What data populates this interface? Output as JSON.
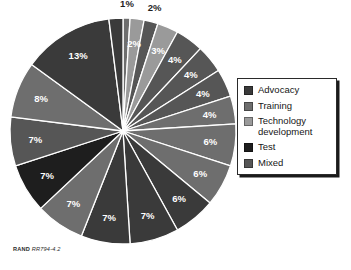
{
  "figure": {
    "source_note_prefix": "RAND",
    "source_note_id": "RR794-4.2"
  },
  "legend": {
    "position": "right",
    "items": [
      {
        "label": "Advocacy",
        "color": "#3a3a3a"
      },
      {
        "label": "Training",
        "color": "#6e6e6e"
      },
      {
        "label": "Technology\ndevelopment",
        "color": "#9a9a9a"
      },
      {
        "label": "Test",
        "color": "#1e1e1e"
      },
      {
        "label": "Mixed",
        "color": "#565656"
      }
    ]
  },
  "chart_data": {
    "type": "pie",
    "title": "",
    "xlabel": "",
    "ylabel": "",
    "units": "percent",
    "total": 100,
    "start_angle_deg": 0,
    "direction": "clockwise",
    "legend_position": "right",
    "grid": false,
    "categories": [
      "Advocacy",
      "Training",
      "Technology development",
      "Test",
      "Mixed"
    ],
    "category_colors": {
      "Advocacy": "#3a3a3a",
      "Training": "#6e6e6e",
      "Technology development": "#9a9a9a",
      "Test": "#1e1e1e",
      "Mixed": "#565656"
    },
    "slices": [
      {
        "label": "1%",
        "value": 1,
        "category": "Training",
        "color": "#6e6e6e",
        "label_placement": "outside"
      },
      {
        "label": "2%",
        "value": 2,
        "category": "Technology development",
        "color": "#9a9a9a",
        "label_placement": "inside"
      },
      {
        "label": "2%",
        "value": 2,
        "category": "Mixed",
        "color": "#565656",
        "label_placement": "outside"
      },
      {
        "label": "3%",
        "value": 3,
        "category": "Technology development",
        "color": "#9a9a9a",
        "label_placement": "inside"
      },
      {
        "label": "4%",
        "value": 4,
        "category": "Mixed",
        "color": "#565656",
        "label_placement": "inside"
      },
      {
        "label": "4%",
        "value": 4,
        "category": "Mixed",
        "color": "#565656",
        "label_placement": "inside"
      },
      {
        "label": "4%",
        "value": 4,
        "category": "Mixed",
        "color": "#565656",
        "label_placement": "inside"
      },
      {
        "label": "4%",
        "value": 4,
        "category": "Training",
        "color": "#6e6e6e",
        "label_placement": "inside"
      },
      {
        "label": "6%",
        "value": 6,
        "category": "Training",
        "color": "#6e6e6e",
        "label_placement": "inside"
      },
      {
        "label": "6%",
        "value": 6,
        "category": "Training",
        "color": "#6e6e6e",
        "label_placement": "inside"
      },
      {
        "label": "6%",
        "value": 6,
        "category": "Advocacy",
        "color": "#3a3a3a",
        "label_placement": "inside"
      },
      {
        "label": "7%",
        "value": 7,
        "category": "Advocacy",
        "color": "#3a3a3a",
        "label_placement": "inside"
      },
      {
        "label": "7%",
        "value": 7,
        "category": "Advocacy",
        "color": "#3a3a3a",
        "label_placement": "inside"
      },
      {
        "label": "7%",
        "value": 7,
        "category": "Training",
        "color": "#6e6e6e",
        "label_placement": "inside"
      },
      {
        "label": "7%",
        "value": 7,
        "category": "Test",
        "color": "#1e1e1e",
        "label_placement": "inside"
      },
      {
        "label": "7%",
        "value": 7,
        "category": "Mixed",
        "color": "#565656",
        "label_placement": "inside"
      },
      {
        "label": "8%",
        "value": 8,
        "category": "Training",
        "color": "#6e6e6e",
        "label_placement": "inside"
      },
      {
        "label": "13%",
        "value": 13,
        "category": "Advocacy",
        "color": "#3a3a3a",
        "label_placement": "inside"
      },
      {
        "label": "2%",
        "value": 2,
        "category": "Advocacy",
        "color": "#3a3a3a",
        "label_placement": "none"
      }
    ]
  }
}
